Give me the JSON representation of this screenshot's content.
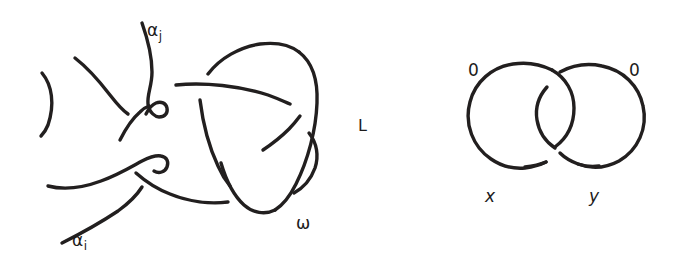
{
  "figure": {
    "kind": "hand-drawn knot theory diagram",
    "background_color": "#ffffff",
    "ink_color": "#221f1f",
    "width": 674,
    "height": 272
  },
  "left_diagram": {
    "name": "tangle-with-omega-loop",
    "labels": {
      "alpha_j_base": "α",
      "alpha_j_sub": "j",
      "alpha_i_base": "α",
      "alpha_i_sub": "i",
      "omega": "ω"
    }
  },
  "middle": {
    "link_label": "L"
  },
  "right_diagram": {
    "name": "hopf-link",
    "labels": {
      "framing_left": "0",
      "framing_right": "0",
      "component_left": "x",
      "component_right": "y"
    }
  }
}
